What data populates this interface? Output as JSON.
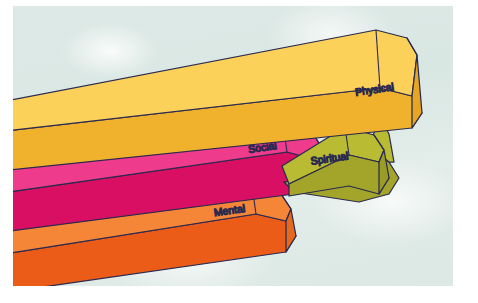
{
  "figure": {
    "credit": "Delmar/Cengage Learning",
    "background_color": "#dde9e6",
    "outline_color": "#2a2a50"
  },
  "bars": [
    {
      "id": "physical",
      "label": "Physical",
      "label_color": "#4a3508",
      "top_color": "#fcd15a",
      "front_color": "#f0b12c",
      "end_color": "#e8a522",
      "order": 1
    },
    {
      "id": "social",
      "label": "Social",
      "label_color": "#4a1040",
      "top_color": "#ee3b8c",
      "front_color": "#d80f62",
      "end_color": "#e62a7b",
      "order": 2
    },
    {
      "id": "spiritual",
      "label": "Spiritual",
      "label_color": "#3c3a08",
      "top_color": "#b9bb33",
      "front_color": "#a3a52a",
      "end_color": "#9a9c26",
      "order": 3
    },
    {
      "id": "mental",
      "label": "Mental",
      "label_color": "#5a1a05",
      "top_color": "#f58638",
      "front_color": "#ea5c18",
      "end_color": "#e5681f",
      "order": 4
    }
  ]
}
